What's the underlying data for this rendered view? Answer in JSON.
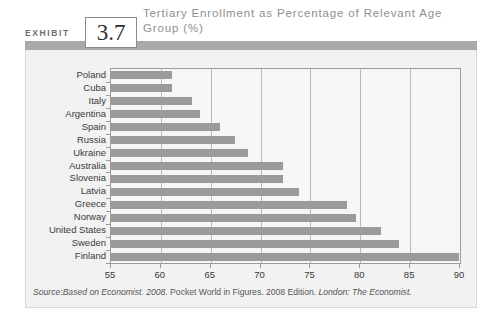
{
  "exhibit": {
    "label": "EXHIBIT",
    "number": "3.7"
  },
  "chart_data": {
    "type": "bar",
    "orientation": "horizontal",
    "title": "Tertiary Enrollment as Percentage of Relevant Age Group (%)",
    "xlabel": "",
    "ylabel": "",
    "xlim": [
      55,
      90
    ],
    "xticks": [
      55,
      60,
      65,
      70,
      75,
      80,
      85,
      90
    ],
    "grid": "vertical",
    "legend": "none",
    "bar_color": "#9b9b9b",
    "categories": [
      "Poland",
      "Cuba",
      "Italy",
      "Argentina",
      "Spain",
      "Russia",
      "Ukraine",
      "Australia",
      "Slovenia",
      "Latvia",
      "Greece",
      "Norway",
      "United States",
      "Sweden",
      "Finland"
    ],
    "values": [
      61.2,
      61.2,
      63.2,
      64.0,
      66.0,
      67.5,
      68.8,
      72.3,
      72.3,
      74.0,
      78.8,
      79.7,
      82.2,
      84.0,
      90.0
    ]
  },
  "source": {
    "prefix": "Source:",
    "italic_one": "Based on Economist. 2008.",
    "plain_one": " Pocket World in Figures. 2008 Edition.",
    "italic_two": " London: The Economist."
  },
  "colors": {
    "band": "#a9a9a9",
    "panel_bg": "#f2f2f2",
    "plot_bg": "#f6f6f6",
    "bar": "#9b9b9b",
    "title_text": "#8f8f8f",
    "axis_text": "#3a3a3a"
  }
}
